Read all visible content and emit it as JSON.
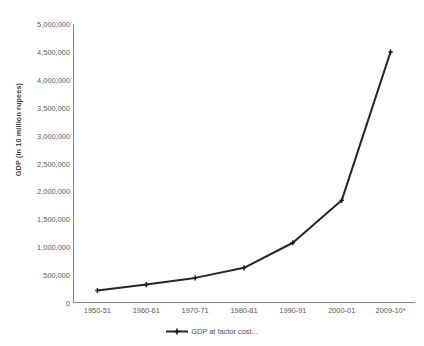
{
  "chart_data": {
    "type": "line",
    "title": "",
    "subtitle": "",
    "xlabel": "",
    "ylabel": "GDP (in 10 million rupees)",
    "categories": [
      "1950-51",
      "1960-61",
      "1970-71",
      "1980-81",
      "1990-91",
      "2000-01",
      "2009-10*"
    ],
    "series": [
      {
        "name": "GDP at factor cost...",
        "values": [
          224000,
          330000,
          450000,
          630000,
          1080000,
          1840000,
          4500000
        ]
      }
    ],
    "ylim": [
      0,
      5000000
    ],
    "ytick_labels": [
      "0",
      "500,000",
      "1,000,000",
      "1,500,000",
      "2,000,000",
      "2,500,000",
      "3,000,000",
      "3,500,000",
      "4,000,000",
      "4,500,000",
      "5,000,000"
    ],
    "ytick_values": [
      0,
      500000,
      1000000,
      1500000,
      2000000,
      2500000,
      3000000,
      3500000,
      4000000,
      4500000,
      5000000
    ],
    "grid": false,
    "legend_position": "bottom",
    "colors": {
      "series_line": "#262626",
      "marker": "#1a1a1a",
      "axis": "#808080",
      "tick_label": "#585858",
      "axis_title": "#3f3f3f",
      "background": "#ffffff"
    }
  },
  "legend": {
    "entries": [
      {
        "label": "GDP at factor cost..."
      }
    ]
  }
}
